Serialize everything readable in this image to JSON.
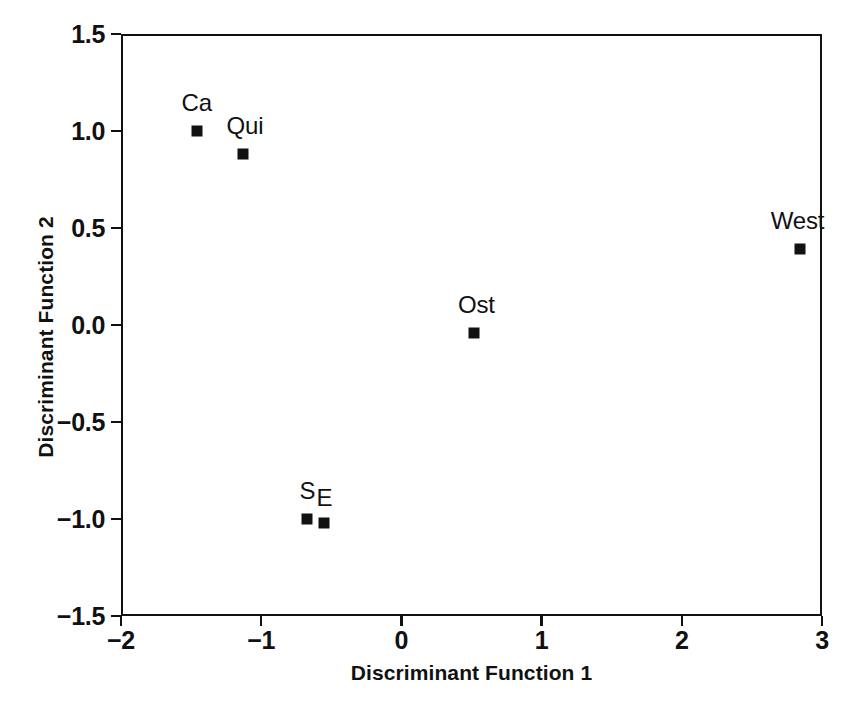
{
  "chart_data": {
    "type": "scatter",
    "title": "",
    "xlabel": "Discriminant Function 1",
    "ylabel": "Discriminant Function 2",
    "xlim": [
      -2,
      3
    ],
    "ylim": [
      -1.5,
      1.5
    ],
    "xticks": [
      "-2",
      "-1",
      "0",
      "1",
      "2",
      "3"
    ],
    "xtick_values": [
      -2,
      -1,
      0,
      1,
      2,
      3
    ],
    "yticks": [
      "1.5",
      "1.0",
      "0.5",
      "0.0",
      "-0.5",
      "-1.0",
      "-1.5"
    ],
    "ytick_values": [
      1.5,
      1.0,
      0.5,
      0.0,
      -0.5,
      -1.0,
      -1.5
    ],
    "grid": false,
    "legend": "none",
    "marker": "filled-square",
    "marker_color": "#111111",
    "points": [
      {
        "label": "Ca",
        "x": -1.46,
        "y": 1.0,
        "label_dx": 0,
        "label_dy": -8
      },
      {
        "label": "Qui",
        "x": -1.13,
        "y": 0.88,
        "label_dx": 2,
        "label_dy": -8
      },
      {
        "label": "West",
        "x": 2.84,
        "y": 0.39,
        "label_dx": -2,
        "label_dy": -8
      },
      {
        "label": "Ost",
        "x": 0.52,
        "y": -0.04,
        "label_dx": 2,
        "label_dy": -8
      },
      {
        "label": "S",
        "x": -0.67,
        "y": -1.0,
        "label_dx": 0,
        "label_dy": -8
      },
      {
        "label": "E",
        "x": -0.55,
        "y": -1.02,
        "label_dx": 0,
        "label_dy": -5
      }
    ]
  },
  "figure": {
    "background_color": "#ffffff",
    "axis_color": "#111111"
  }
}
